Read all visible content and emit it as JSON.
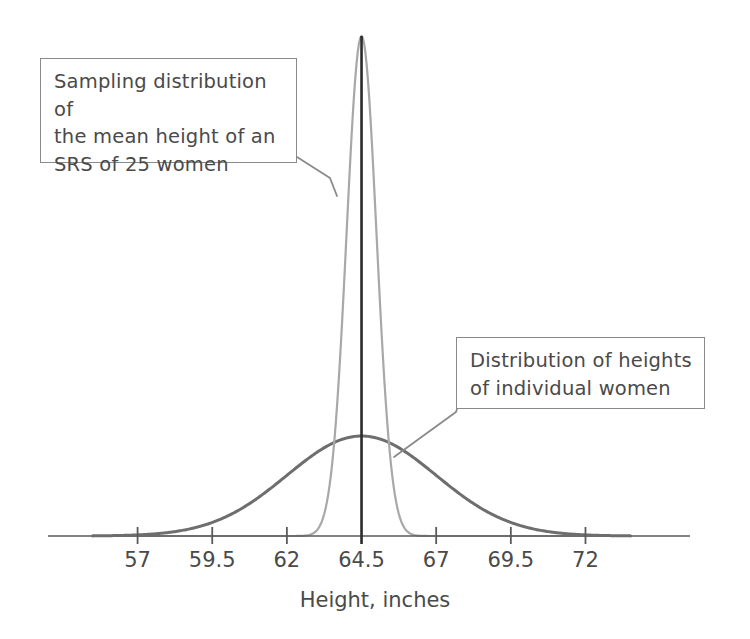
{
  "chart_data": {
    "type": "line",
    "title": "",
    "xlabel": "Height, inches",
    "ylabel": "",
    "xlim": [
      54.0,
      75.5
    ],
    "grid": false,
    "legend_position": "annotations",
    "tick_labels": [
      "57",
      "59.5",
      "62",
      "64.5",
      "67",
      "69.5",
      "72"
    ],
    "tick_values": [
      57,
      59.5,
      62,
      64.5,
      67,
      69.5,
      72
    ],
    "center_line_value": 64.5,
    "series": [
      {
        "name": "Distribution of heights of individual women",
        "kind": "normal-density",
        "mean": 64.5,
        "sd": 2.5,
        "color": "#6e6e6e",
        "line_width": 3.0,
        "peak_pixel_height": 100
      },
      {
        "name": "Sampling distribution of the mean height of an SRS of 25 women",
        "kind": "normal-density",
        "mean": 64.5,
        "sd": 0.5,
        "sample_size": 25,
        "color": "#a8a8a8",
        "line_width": 2.2,
        "peak_pixel_height": 500
      }
    ]
  },
  "annotations": {
    "sampling": {
      "text": "Sampling distribution of\nthe mean height of an\nSRS of 25 women"
    },
    "individual": {
      "text": "Distribution of heights\nof individual women"
    }
  },
  "axis": {
    "title": "Height, inches",
    "ticks": [
      {
        "label": "57",
        "value": 57
      },
      {
        "label": "59.5",
        "value": 59.5
      },
      {
        "label": "62",
        "value": 62
      },
      {
        "label": "64.5",
        "value": 64.5
      },
      {
        "label": "67",
        "value": 67
      },
      {
        "label": "69.5",
        "value": 69.5
      },
      {
        "label": "72",
        "value": 72
      }
    ]
  },
  "colors": {
    "axis": "#5a5a5a",
    "center_line": "#2b2b2b",
    "wide_curve": "#6e6e6e",
    "narrow_curve": "#a8a8a8",
    "box_border": "#8a8a8a",
    "text": "#4a4a4a",
    "background": "#ffffff"
  }
}
